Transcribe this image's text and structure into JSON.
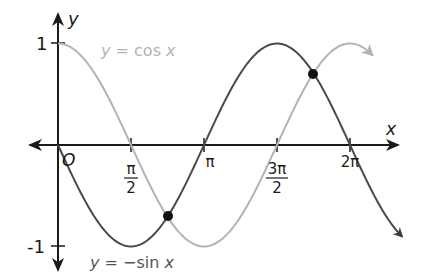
{
  "chart_data": {
    "type": "line",
    "title": "",
    "xlabel": "x",
    "ylabel": "y",
    "origin_label": "O",
    "x_ticks": [
      {
        "value": 1.5708,
        "num": "π",
        "den": "2"
      },
      {
        "value": 3.1416,
        "num": "π",
        "den": ""
      },
      {
        "value": 4.7124,
        "num": "3π",
        "den": "2"
      },
      {
        "value": 6.2832,
        "num": "2π",
        "den": ""
      }
    ],
    "y_ticks": [
      {
        "value": 1,
        "label": "1"
      },
      {
        "value": -1,
        "label": "-1"
      }
    ],
    "series": [
      {
        "name": "y = cos x",
        "function": "cos",
        "color": "#b3b3b3",
        "x_range": [
          0,
          6.75
        ]
      },
      {
        "name": "y = −sin x",
        "function": "-sin",
        "color": "#4a4a4a",
        "x_range": [
          0,
          7.4
        ]
      }
    ],
    "intersections": [
      {
        "x": 2.3562,
        "x_label": "3π/4",
        "y": -0.7071
      },
      {
        "x": 5.4978,
        "x_label": "7π/4",
        "y": 0.7071
      }
    ],
    "xlim": [
      -0.6,
      7.4
    ],
    "ylim": [
      -1.3,
      1.3
    ],
    "grid": false,
    "legend": "inline labels"
  },
  "labels": {
    "cos": "y = cos x",
    "negsin": "y = −sin x",
    "x_axis": "x",
    "y_axis": "y",
    "origin": "O",
    "y_one": "1",
    "y_neg_one": "-1",
    "pi_half_num": "π",
    "pi_half_den": "2",
    "pi": "π",
    "three_pi_half_num": "3π",
    "three_pi_half_den": "2",
    "two_pi": "2π"
  }
}
